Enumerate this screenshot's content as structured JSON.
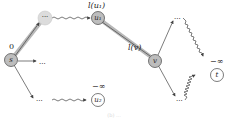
{
  "diagram": {
    "type": "graph",
    "colors": {
      "highlight_fill": "#bdbdbd",
      "faded_fill": "#dcdcdc",
      "plain_fill": "#ffffff",
      "stroke": "#444444",
      "highlight_path": "#b0b0b0"
    },
    "nodes": {
      "s": {
        "label": "s",
        "value_label": "0"
      },
      "u1": {
        "label": "u₁",
        "value_label": "l(u₁)"
      },
      "v": {
        "label": "v",
        "value_label": "l(v)"
      },
      "u2": {
        "label": "u₂",
        "value_label": "−∞"
      },
      "t": {
        "label": "t",
        "value_label": "−∞"
      },
      "top_dots": {
        "label": "···"
      }
    },
    "ellipses": {
      "mid": "···",
      "bottom_left": "···",
      "top_right": "···",
      "bottom_right": "···"
    },
    "caption": "(b) ..."
  }
}
